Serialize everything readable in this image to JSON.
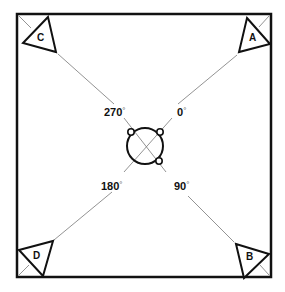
{
  "diagram": {
    "type": "speaker-placement-layout",
    "colors": {
      "stroke": "#111111",
      "guide_line": "#777777",
      "background": "#ffffff"
    },
    "center": {
      "shape": "circle",
      "has_crosshair": true,
      "mount_tabs": [
        "top-left",
        "top-right",
        "bottom-right"
      ]
    },
    "angles": [
      {
        "value": "0",
        "unit": "°",
        "position": "upper-right"
      },
      {
        "value": "90",
        "unit": "°",
        "position": "lower-right"
      },
      {
        "value": "180",
        "unit": "°",
        "position": "lower-left"
      },
      {
        "value": "270",
        "unit": "°",
        "position": "upper-left"
      }
    ],
    "corners": [
      {
        "label": "A",
        "position": "top-right"
      },
      {
        "label": "B",
        "position": "bottom-right"
      },
      {
        "label": "C",
        "position": "top-left"
      },
      {
        "label": "D",
        "position": "bottom-left"
      }
    ]
  }
}
